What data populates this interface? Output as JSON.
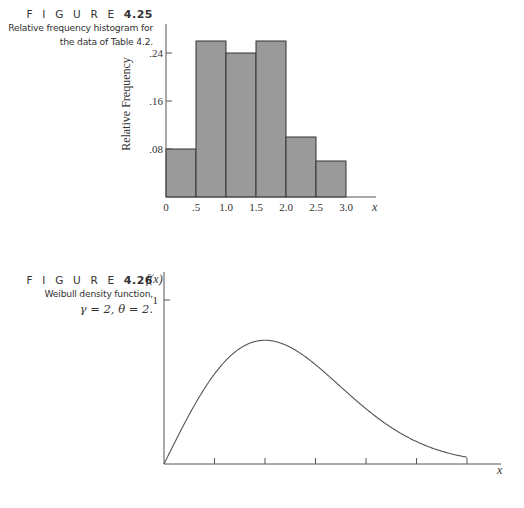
{
  "figures": [
    {
      "label": "F I G U R E",
      "number": "4.25",
      "caption_line1": "Relative frequency histogram for",
      "caption_line2": "the data of Table 4.2."
    },
    {
      "label": "F I G U R E",
      "number": "4.26",
      "caption_line1": "Weibull density function,",
      "caption_math": "γ = 2, θ = 2."
    }
  ],
  "colors": {
    "bar_fill": "#9a9a9a",
    "bar_stroke": "#333333",
    "axis": "#555555",
    "curve": "#555555"
  },
  "chart_data": [
    {
      "type": "bar",
      "title": "Relative frequency histogram for the data of Table 4.2.",
      "xlabel": "x",
      "ylabel": "Relative Frequency",
      "bin_edges": [
        0,
        0.5,
        1.0,
        1.5,
        2.0,
        2.5,
        3.0
      ],
      "categories": [
        "0–.5",
        ".5–1.0",
        "1.0–1.5",
        "1.5–2.0",
        "2.0–2.5",
        "2.5–3.0"
      ],
      "values": [
        0.08,
        0.26,
        0.24,
        0.26,
        0.1,
        0.06
      ],
      "x_tick_labels": [
        "0",
        ".5",
        "1.0",
        "1.5",
        "2.0",
        "2.5",
        "3.0"
      ],
      "y_ticks": [
        0.08,
        0.16,
        0.24
      ],
      "y_tick_labels": [
        ".08",
        ".16",
        ".24"
      ],
      "ylim": [
        0,
        0.28
      ],
      "xlim": [
        0,
        3.5
      ],
      "grid": false,
      "legend": null
    },
    {
      "type": "line",
      "title": "Weibull density function, γ = 2, θ = 2.",
      "xlabel": "x",
      "ylabel": "f(x)",
      "function": "f(x) = x·exp(-x²/2)",
      "x": [
        0,
        0.25,
        0.5,
        0.75,
        1.0,
        1.25,
        1.5,
        1.75,
        2.0,
        2.25,
        2.5,
        2.75,
        3.0
      ],
      "y": [
        0,
        0.242,
        0.441,
        0.566,
        0.607,
        0.572,
        0.487,
        0.379,
        0.271,
        0.179,
        0.11,
        0.062,
        0.033
      ],
      "y_ticks": [
        1
      ],
      "y_tick_labels": [
        "1"
      ],
      "x_ticks": [
        0.5,
        1.0,
        1.5,
        2.0,
        2.5,
        3.0
      ],
      "x_tick_labels": [],
      "grid": false,
      "legend": null
    }
  ]
}
